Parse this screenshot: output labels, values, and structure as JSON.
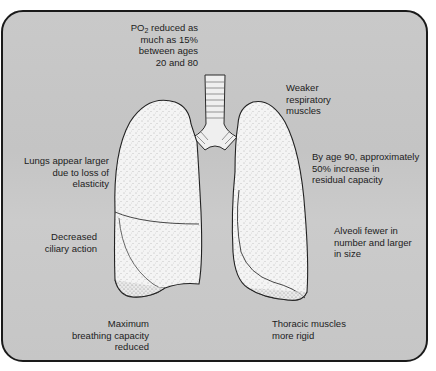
{
  "diagram": {
    "colors": {
      "background": "#c8c8c8",
      "border": "#1a1a1a",
      "lung_fill": "#f4f4f4",
      "text": "#1c1c1c"
    },
    "labels": {
      "po2": {
        "prefix": "PO",
        "subscript": "2",
        "line1_rest": " reduced as",
        "line2": "much as 15%",
        "line3": "between ages",
        "line4": "20 and 80"
      },
      "weaker_muscles": {
        "line1": "Weaker",
        "line2": "respiratory",
        "line3": "muscles"
      },
      "residual_capacity": {
        "line1": "By age 90, approximately",
        "line2": "50% increase in",
        "line3": "residual capacity"
      },
      "lungs_larger": {
        "line1": "Lungs appear larger",
        "line2": "due to loss of",
        "line3": "elasticity"
      },
      "ciliary": {
        "line1": "Decreased",
        "line2": "ciliary action"
      },
      "alveoli": {
        "line1": "Alveoli fewer in",
        "line2": "number and larger",
        "line3": "in size"
      },
      "breathing_capacity": {
        "line1": "Maximum",
        "line2": "breathing capacity",
        "line3": "reduced"
      },
      "thoracic": {
        "line1": "Thoracic muscles",
        "line2": "more rigid"
      }
    }
  }
}
